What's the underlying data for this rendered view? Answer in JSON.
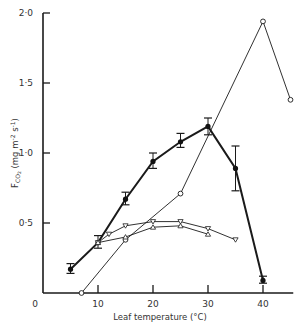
{
  "chart_data": {
    "type": "line",
    "title": "",
    "xlabel": "Leaf temperature (°C)",
    "ylabel": "F_CO2 (mg m^-2 s^-1)",
    "ylabel_parts": {
      "main": "F",
      "sub": "CO",
      "sub2": "2",
      "units": "(mg m",
      "exp1": "-2",
      "mid": " s",
      "exp2": "-1",
      "end": ")"
    },
    "xlim": [
      0,
      46
    ],
    "ylim": [
      0,
      2.0
    ],
    "x_ticks": [
      0,
      10,
      20,
      30,
      40
    ],
    "x_tick_labels": [
      "0",
      "10",
      "20",
      "30",
      "40"
    ],
    "y_ticks": [
      0.5,
      1.0,
      1.5,
      2.0
    ],
    "y_tick_labels": [
      "0·5",
      "1·0",
      "1·5",
      "2·0"
    ],
    "grid": false,
    "legend": null,
    "series": [
      {
        "name": "filled circles (with error bars)",
        "marker": "filled-circle",
        "line": "thick",
        "x": [
          5,
          10,
          15,
          20,
          25,
          30,
          35,
          40
        ],
        "values": [
          0.17,
          0.36,
          0.67,
          0.94,
          1.08,
          1.19,
          0.89,
          0.09
        ],
        "error_low": [
          0.14,
          0.32,
          0.63,
          0.89,
          1.04,
          1.13,
          0.73,
          0.07
        ],
        "error_high": [
          0.21,
          0.41,
          0.72,
          1.0,
          1.14,
          1.25,
          1.05,
          0.12
        ]
      },
      {
        "name": "open circles",
        "marker": "open-circle",
        "line": "thin",
        "x": [
          7,
          15,
          25,
          40,
          45
        ],
        "values": [
          0.0,
          0.38,
          0.71,
          1.94,
          1.38
        ]
      },
      {
        "name": "open triangles (down)",
        "marker": "triangle-down",
        "line": "thin",
        "x": [
          10,
          12,
          15,
          20,
          25,
          30,
          35
        ],
        "values": [
          0.36,
          0.42,
          0.48,
          0.51,
          0.51,
          0.46,
          0.38
        ]
      },
      {
        "name": "open triangles (up)",
        "marker": "triangle-up",
        "line": "thin",
        "x": [
          10,
          15,
          20,
          25,
          30
        ],
        "values": [
          0.36,
          0.4,
          0.47,
          0.48,
          0.42
        ]
      }
    ]
  }
}
